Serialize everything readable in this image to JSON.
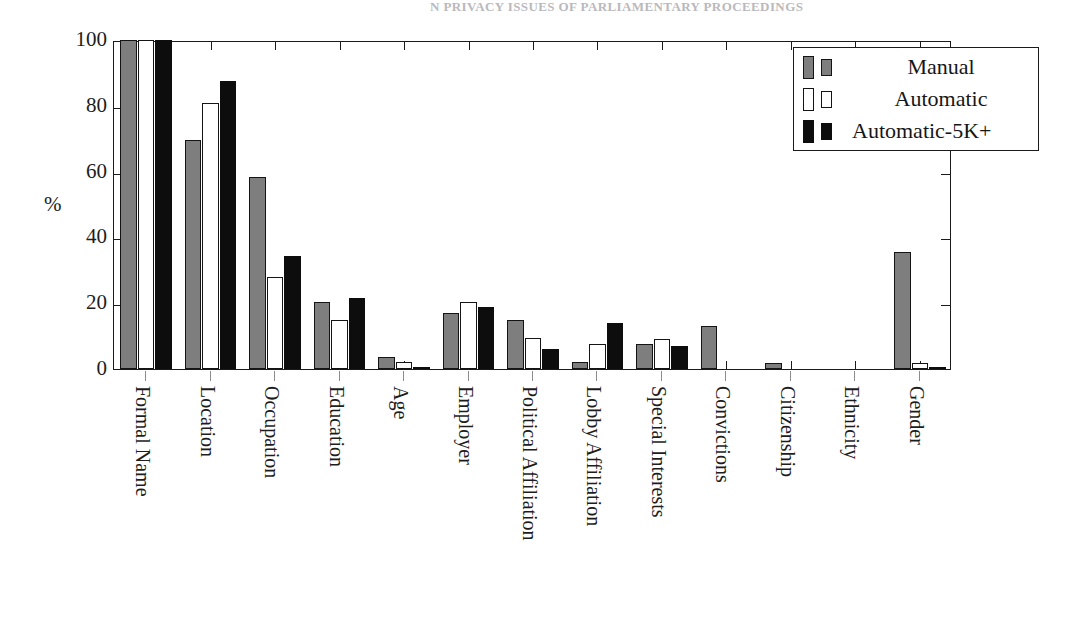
{
  "page_header": "N PRIVACY ISSUES OF PARLIAMENTARY PROCEEDINGS",
  "axis": {
    "ylabel": "%",
    "yticks": [
      0,
      20,
      40,
      60,
      80,
      100
    ],
    "ylim": [
      0,
      100
    ]
  },
  "legend": {
    "position": "top-right",
    "entries": [
      {
        "label": "Manual",
        "key": "manual",
        "color": "#7e7e7e"
      },
      {
        "label": "Automatic",
        "key": "automatic",
        "color": "#ffffff"
      },
      {
        "label": "Automatic-5K+",
        "key": "automatic5k",
        "color": "#0d0d0d"
      }
    ]
  },
  "chart_data": {
    "type": "bar",
    "title": "",
    "xlabel": "",
    "ylabel": "%",
    "ylim": [
      0,
      100
    ],
    "grid": false,
    "legend_position": "top-right",
    "categories": [
      "Formal Name",
      "Location",
      "Occupation",
      "Education",
      "Age",
      "Employer",
      "Political Affiliation",
      "Lobby Affiliation",
      "Special Interests",
      "Convictions",
      "Citizenship",
      "Ethnicity",
      "Gender"
    ],
    "series": [
      {
        "name": "Manual",
        "color": "#7e7e7e",
        "values": [
          100,
          69.5,
          58.5,
          20.5,
          3.8,
          17,
          15,
          2,
          7.5,
          13,
          1.8,
          0,
          35.5
        ]
      },
      {
        "name": "Automatic",
        "color": "#ffffff",
        "values": [
          100,
          81,
          28,
          15,
          2.2,
          20.5,
          9.5,
          7.5,
          9,
          0,
          0,
          0,
          1.8
        ]
      },
      {
        "name": "Automatic-5K+",
        "color": "#0d0d0d",
        "values": [
          100,
          87.5,
          34.5,
          21.5,
          0.6,
          19,
          6,
          14,
          7,
          0,
          0,
          0,
          0.6
        ]
      }
    ]
  }
}
